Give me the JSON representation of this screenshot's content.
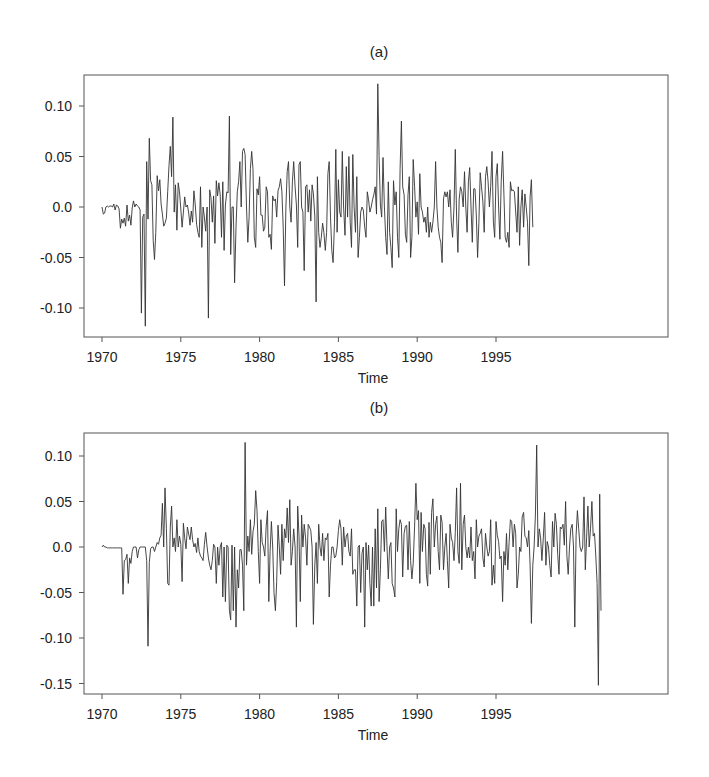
{
  "chart_data": [
    {
      "type": "line",
      "title": "(a)",
      "xlabel": "Time",
      "ylabel": "",
      "x_start": 1970.0,
      "x_step": 0.08333,
      "xlim": [
        1968.9,
        1999.8
      ],
      "ylim": [
        -0.13,
        0.13
      ],
      "xticks": [
        1970,
        1975,
        1980,
        1985,
        1990,
        1995
      ],
      "yticks": [
        0.1,
        0.05,
        0.0,
        -0.05,
        -0.1
      ],
      "ytick_labels": [
        "0.10",
        "0.05",
        "0.0",
        "-0.05",
        "-0.10"
      ],
      "grid": false,
      "legend": null,
      "series": [
        {
          "name": "a",
          "values": [
            0.0,
            -0.007,
            -0.006,
            0.0,
            0.001,
            0.0,
            0.001,
            0.001,
            0.0,
            0.003,
            -0.003,
            0.002,
            0.001,
            -0.002,
            -0.021,
            -0.012,
            -0.016,
            -0.011,
            -0.019,
            0.002,
            -0.014,
            -0.008,
            -0.018,
            -0.001,
            0.006,
            0.0,
            0.003,
            0.001,
            0.0,
            -0.003,
            -0.105,
            -0.01,
            -0.007,
            -0.118,
            0.045,
            -0.012,
            0.068,
            0.026,
            0.022,
            -0.033,
            -0.052,
            -0.025,
            0.031,
            0.016,
            0.027,
            0.003,
            -0.007,
            -0.019,
            -0.016,
            -0.011,
            0.015,
            0.041,
            0.06,
            0.03,
            0.089,
            -0.005,
            0.022,
            -0.023,
            0.024,
            0.015,
            -0.002,
            -0.02,
            -0.005,
            0.01,
            0.0,
            0.002,
            -0.006,
            -0.018,
            -0.004,
            -0.015,
            0.016,
            0.003,
            -0.017,
            -0.025,
            -0.03,
            0.02,
            -0.04,
            0.0,
            -0.01,
            -0.024,
            0.0,
            -0.11,
            0.017,
            0.009,
            -0.015,
            0.011,
            -0.036,
            0.026,
            0.011,
            0.024,
            0.012,
            -0.03,
            0.025,
            -0.043,
            0.002,
            0.015,
            0.014,
            0.09,
            -0.047,
            0.0,
            0.0,
            -0.075,
            -0.02,
            0.015,
            0.025,
            0.045,
            0.0,
            0.055,
            0.058,
            0.052,
            0.0,
            -0.035,
            -0.01,
            0.038,
            0.055,
            0.037,
            -0.03,
            -0.04,
            0.018,
            0.012,
            0.03,
            -0.008,
            -0.008,
            -0.024,
            -0.02,
            0.02,
            0.015,
            -0.03,
            -0.027,
            -0.042,
            0.011,
            0.006,
            0.008,
            -0.01,
            0.016,
            0.02,
            0.028,
            0.015,
            -0.02,
            -0.078,
            0.0,
            0.035,
            0.045,
            0.0,
            -0.015,
            0.025,
            0.045,
            0.02,
            0.002,
            -0.04,
            0.042,
            0.045,
            0.0,
            -0.005,
            -0.063,
            0.02,
            0.022,
            -0.005,
            0.017,
            -0.014,
            0.022,
            0.013,
            -0.009,
            -0.094,
            0.03,
            -0.025,
            -0.04,
            -0.03,
            -0.016,
            -0.025,
            -0.043,
            -0.025,
            0.033,
            0.045,
            -0.01,
            -0.043,
            -0.055,
            -0.015,
            0.057,
            -0.025,
            0.027,
            -0.005,
            -0.01,
            0.055,
            0.0,
            -0.028,
            0.04,
            -0.01,
            0.05,
            -0.015,
            -0.04,
            0.052,
            0.0,
            -0.025,
            0.03,
            -0.05,
            -0.03,
            -0.005,
            0.0,
            -0.003,
            -0.02,
            -0.03,
            0.015,
            0.007,
            -0.005,
            0.0,
            0.007,
            0.012,
            0.02,
            -0.007,
            0.122,
            0.05,
            0.002,
            -0.01,
            0.049,
            0.0,
            -0.03,
            -0.047,
            0.025,
            -0.025,
            -0.04,
            -0.06,
            0.026,
            0.002,
            0.015,
            -0.03,
            -0.05,
            0.038,
            0.085,
            0.02,
            0.012,
            -0.027,
            -0.035,
            0.012,
            0.03,
            -0.05,
            -0.03,
            0.047,
            0.02,
            -0.01,
            0.005,
            -0.027,
            0.033,
            0.0,
            -0.005,
            -0.015,
            -0.01,
            -0.025,
            0.0,
            -0.03,
            -0.015,
            -0.025,
            -0.015,
            0.0,
            0.045,
            0.0,
            -0.02,
            -0.03,
            -0.035,
            -0.055,
            0.008,
            0.015,
            0.01,
            0.015,
            0.0,
            0.017,
            -0.015,
            -0.03,
            0.0,
            0.057,
            -0.01,
            -0.045,
            0.008,
            0.02,
            0.015,
            0.0,
            0.035,
            0.0,
            -0.025,
            0.025,
            0.039,
            0.0,
            -0.035,
            0.018,
            0.018,
            -0.008,
            -0.05,
            -0.015,
            0.034,
            0.02,
            0.005,
            -0.025,
            0.03,
            0.04,
            0.025,
            0.0,
            0.02,
            0.055,
            -0.015,
            -0.03,
            0.03,
            0.043,
            0.0,
            -0.032,
            0.025,
            0.055,
            0.013,
            -0.03,
            -0.035,
            -0.025,
            -0.04,
            0.025,
            0.016,
            0.017,
            0.015,
            -0.005,
            -0.025,
            0.02,
            -0.038,
            0.0,
            0.017,
            -0.02,
            0.013,
            0.0,
            -0.015,
            -0.058,
            0.01,
            0.027,
            -0.02
          ]
        }
      ]
    },
    {
      "type": "line",
      "title": "(b)",
      "xlabel": "Time",
      "ylabel": "",
      "x_start": 1970.0,
      "x_step": 0.08333,
      "xlim": [
        1968.9,
        1999.8
      ],
      "ylim": [
        -0.16,
        0.125
      ],
      "xticks": [
        1970,
        1975,
        1980,
        1985,
        1990,
        1995
      ],
      "yticks": [
        0.1,
        0.05,
        0.0,
        -0.05,
        -0.1,
        -0.15
      ],
      "ytick_labels": [
        "0.10",
        "0.05",
        "0.0",
        "-0.05",
        "-0.10",
        "-0.15"
      ],
      "grid": false,
      "legend": null,
      "series": [
        {
          "name": "b",
          "values": [
            0.0,
            0.002,
            0.0,
            0.0,
            -0.001,
            -0.001,
            -0.001,
            -0.001,
            -0.001,
            -0.001,
            -0.001,
            -0.001,
            -0.001,
            -0.001,
            -0.001,
            -0.001,
            -0.052,
            -0.015,
            -0.014,
            -0.008,
            -0.04,
            -0.012,
            -0.018,
            -0.005,
            0.0,
            0.0,
            0.0,
            -0.012,
            -0.003,
            0.0,
            0.0,
            0.0,
            0.0,
            0.0,
            -0.015,
            -0.109,
            -0.017,
            -0.002,
            0.0,
            0.0,
            -0.005,
            0.0,
            0.005,
            0.003,
            0.01,
            0.013,
            0.048,
            0.0,
            0.065,
            0.02,
            -0.04,
            -0.042,
            0.022,
            0.045,
            0.0,
            0.01,
            -0.005,
            0.03,
            0.0,
            0.012,
            0.003,
            -0.038,
            0.026,
            0.01,
            -0.002,
            0.022,
            0.014,
            0.008,
            0.022,
            0.008,
            0.0,
            0.004,
            -0.006,
            0.01,
            -0.005,
            -0.01,
            -0.012,
            -0.015,
            0.003,
            0.016,
            0.0,
            -0.012,
            -0.02,
            -0.025,
            -0.015,
            0.003,
            0.0,
            -0.04,
            0.0,
            -0.02,
            0.0,
            0.005,
            -0.055,
            0.0,
            -0.06,
            0.002,
            0.0,
            -0.07,
            -0.08,
            0.002,
            -0.07,
            0.0,
            -0.088,
            -0.025,
            -0.045,
            -0.003,
            -0.003,
            -0.02,
            -0.07,
            0.115,
            -0.02,
            0.012,
            -0.005,
            0.03,
            -0.008,
            0.017,
            0.025,
            0.062,
            0.04,
            -0.005,
            -0.04,
            0.03,
            0.005,
            0.0,
            -0.01,
            0.023,
            0.04,
            -0.06,
            -0.005,
            0.028,
            0.0,
            -0.05,
            -0.07,
            -0.038,
            0.024,
            0.0,
            -0.03,
            0.025,
            -0.015,
            0.02,
            0.01,
            0.043,
            0.005,
            0.052,
            -0.02,
            -0.005,
            0.02,
            0.0,
            -0.088,
            0.045,
            0.012,
            -0.06,
            0.035,
            0.0,
            0.025,
            0.01,
            -0.02,
            0.025,
            0.022,
            0.018,
            0.0,
            -0.085,
            -0.02,
            0.005,
            -0.04,
            0.025,
            0.0,
            -0.01,
            0.015,
            -0.015,
            0.01,
            0.008,
            0.015,
            -0.055,
            -0.02,
            0.0,
            0.0,
            -0.012,
            -0.01,
            0.0,
            0.018,
            0.03,
            0.02,
            -0.02,
            0.022,
            0.0,
            0.012,
            0.015,
            -0.005,
            -0.01,
            0.02,
            -0.03,
            -0.025,
            -0.025,
            -0.065,
            0.0,
            0.002,
            -0.05,
            -0.007,
            0.0,
            -0.088,
            0.005,
            -0.025,
            0.002,
            -0.04,
            -0.065,
            0.0,
            -0.065,
            0.02,
            -0.045,
            0.042,
            -0.06,
            -0.025,
            0.028,
            0.03,
            -0.005,
            0.044,
            0.0,
            -0.035,
            0.0,
            0.005,
            -0.04,
            -0.045,
            -0.055,
            0.042,
            -0.005,
            0.02,
            0.03,
            0.025,
            -0.033,
            0.015,
            0.023,
            0.024,
            -0.025,
            0.028,
            -0.015,
            -0.035,
            -0.018,
            0.023,
            0.07,
            0.03,
            0.04,
            -0.04,
            0.038,
            -0.005,
            0.025,
            0.02,
            -0.03,
            -0.043,
            0.027,
            -0.03,
            0.038,
            0.053,
            0.0,
            0.025,
            0.034,
            -0.005,
            -0.025,
            0.035,
            0.027,
            -0.025,
            0.0,
            0.015,
            -0.015,
            -0.045,
            0.025,
            0.01,
            0.005,
            -0.015,
            0.016,
            0.065,
            -0.005,
            -0.018,
            0.07,
            -0.025,
            0.025,
            0.035,
            0.0,
            -0.012,
            0.0,
            -0.012,
            0.022,
            -0.015,
            -0.005,
            -0.035,
            0.03,
            0.0,
            0.012,
            0.015,
            0.02,
            -0.012,
            -0.022,
            0.015,
            0.0,
            -0.01,
            -0.005,
            0.03,
            -0.042,
            -0.02,
            -0.04,
            0.028,
            0.013,
            0.006,
            -0.013,
            -0.01,
            -0.06,
            -0.005,
            -0.02,
            0.015,
            -0.025,
            0.005,
            0.03,
            0.028,
            0.0,
            0.025,
            0.015,
            -0.045,
            -0.03,
            0.0,
            -0.005,
            0.033,
            0.038,
            0.012,
            0.01,
            0.0,
            0.018,
            -0.02,
            -0.084,
            -0.02,
            0.0,
            0.035,
            0.112,
            0.0,
            0.02,
            0.01,
            -0.015,
            0.01,
            0.038,
            -0.02,
            0.006,
            0.0,
            -0.02,
            -0.033,
            0.028,
            0.0,
            0.037,
            0.025,
            -0.008,
            -0.03,
            0.022,
            0.02,
            0.025,
            0.002,
            0.05,
            -0.01,
            -0.03,
            0.0,
            0.02,
            0.025,
            0.0,
            -0.088,
            0.013,
            0.04,
            0.02,
            0.0,
            -0.005,
            0.0,
            0.055,
            -0.025,
            0.01,
            0.045,
            0.0,
            0.02,
            0.05,
            0.012,
            0.015,
            -0.01,
            -0.04,
            -0.152,
            0.058,
            -0.07
          ]
        }
      ]
    }
  ],
  "panels": [
    {
      "title": "(a)",
      "xlabel": "Time"
    },
    {
      "title": "(b)",
      "xlabel": "Time"
    }
  ]
}
